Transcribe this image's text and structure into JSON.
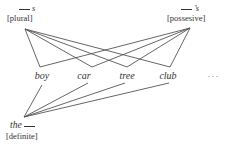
{
  "nodes": {
    "plural": {
      "form": "s",
      "feature": "[plural]"
    },
    "possessive": {
      "form": "’s",
      "feature": "[possesive]"
    },
    "definite": {
      "form": "the",
      "feature": "[definite]"
    }
  },
  "words": [
    {
      "label": "boy"
    },
    {
      "label": "car"
    },
    {
      "label": "tree"
    },
    {
      "label": "club"
    },
    {
      "label": ". . ."
    }
  ],
  "colors": {
    "line": "#555555",
    "text": "#333333",
    "background": "#ffffff"
  }
}
